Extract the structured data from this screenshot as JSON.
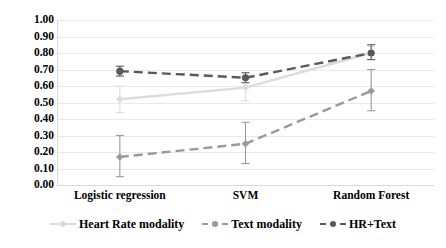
{
  "chart_data": {
    "type": "line",
    "title": "",
    "subtitle": "",
    "xlabel": "",
    "ylabel": "",
    "categories": [
      "Logistic regression",
      "SVM",
      "Random Forest"
    ],
    "ylim": [
      0.0,
      1.0
    ],
    "ytick_labels": [
      "0.00",
      "0.10",
      "0.20",
      "0.30",
      "0.40",
      "0.50",
      "0.60",
      "0.70",
      "0.80",
      "0.90",
      "1.00"
    ],
    "ytick_values": [
      0.0,
      0.1,
      0.2,
      0.3,
      0.4,
      0.5,
      0.6,
      0.7,
      0.8,
      0.9,
      1.0
    ],
    "grid": true,
    "legend_position": "bottom",
    "error_bars": true,
    "series": [
      {
        "name": "Heart Rate modality",
        "color": "#dcdcdc",
        "line_style": "solid",
        "marker": "diamond",
        "values": [
          0.52,
          0.59,
          0.8
        ],
        "err_low": [
          0.08,
          0.08,
          0.04
        ],
        "err_high": [
          0.08,
          0.07,
          0.04
        ]
      },
      {
        "name": "Text modality",
        "color": "#9a9a9a",
        "line_style": "dashed",
        "marker": "diamond",
        "values": [
          0.17,
          0.25,
          0.57
        ],
        "err_low": [
          0.12,
          0.12,
          0.12
        ],
        "err_high": [
          0.13,
          0.13,
          0.13
        ]
      },
      {
        "name": "HR+Text",
        "color": "#595959",
        "line_style": "dashed",
        "marker": "circle",
        "values": [
          0.69,
          0.65,
          0.8
        ],
        "err_low": [
          0.03,
          0.03,
          0.04
        ],
        "err_high": [
          0.03,
          0.03,
          0.05
        ]
      }
    ]
  },
  "legend": {
    "items": [
      {
        "label": "Heart Rate modality"
      },
      {
        "label": "Text modality"
      },
      {
        "label": "HR+Text"
      }
    ]
  }
}
